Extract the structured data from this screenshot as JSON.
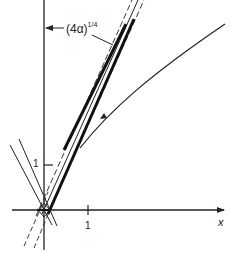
{
  "figure": {
    "type": "mathematical-diagram",
    "axes": {
      "x_label": "x",
      "x_tick": "1",
      "y_tick": "1"
    },
    "annotation": {
      "base": "(4α)",
      "exponent": "1/4"
    },
    "colors": {
      "ink": "#222222",
      "background": "#ffffff"
    }
  }
}
